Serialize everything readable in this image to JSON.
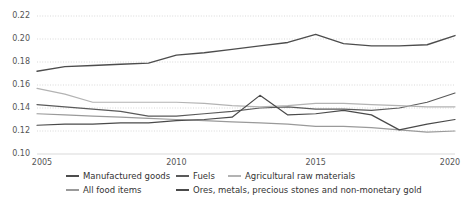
{
  "chart_data": {
    "type": "line",
    "title": "",
    "xlabel": "",
    "ylabel": "",
    "x": [
      2005,
      2006,
      2007,
      2008,
      2009,
      2010,
      2011,
      2012,
      2013,
      2014,
      2015,
      2016,
      2017,
      2018,
      2019,
      2020
    ],
    "xlim": [
      2005,
      2020
    ],
    "ylim": [
      0.1,
      0.22
    ],
    "xticks": [
      "2005",
      "2010",
      "2015",
      "2020"
    ],
    "xtick_values": [
      2005,
      2010,
      2015,
      2020
    ],
    "yticks": [
      "0.22",
      "0.20",
      "0.18",
      "0.16",
      "0.14",
      "0.12",
      "0.10"
    ],
    "ytick_values": [
      0.22,
      0.2,
      0.18,
      0.16,
      0.14,
      0.12,
      0.1
    ],
    "grid": true,
    "grid_style": "dotted-horizontal",
    "legend_position": "bottom",
    "series": [
      {
        "name": "Manufactured goods",
        "color": "#4d4d4d",
        "width": 1.4,
        "values": [
          0.172,
          0.176,
          0.177,
          0.178,
          0.179,
          0.186,
          0.188,
          0.191,
          0.194,
          0.197,
          0.204,
          0.196,
          0.194,
          0.194,
          0.195,
          0.203
        ]
      },
      {
        "name": "Fuels",
        "color": "#5a5a5a",
        "width": 1.2,
        "values": [
          0.143,
          0.141,
          0.139,
          0.137,
          0.133,
          0.133,
          0.135,
          0.137,
          0.14,
          0.141,
          0.139,
          0.139,
          0.138,
          0.14,
          0.145,
          0.153
        ]
      },
      {
        "name": "Agricultural raw materials",
        "color": "#b3b3b3",
        "width": 1.2,
        "values": [
          0.157,
          0.152,
          0.145,
          0.145,
          0.145,
          0.145,
          0.144,
          0.142,
          0.141,
          0.142,
          0.144,
          0.144,
          0.143,
          0.142,
          0.141,
          0.141
        ]
      },
      {
        "name": "All food items",
        "color": "#9a9a9a",
        "width": 1.2,
        "values": [
          0.135,
          0.134,
          0.133,
          0.132,
          0.131,
          0.13,
          0.129,
          0.128,
          0.127,
          0.126,
          0.124,
          0.124,
          0.123,
          0.121,
          0.119,
          0.12
        ]
      },
      {
        "name": "Ores, metals, precious stones and non-monetary gold",
        "color": "#4a4a4a",
        "width": 1.2,
        "values": [
          0.125,
          0.126,
          0.126,
          0.127,
          0.127,
          0.129,
          0.13,
          0.132,
          0.151,
          0.134,
          0.135,
          0.138,
          0.134,
          0.121,
          0.126,
          0.13
        ]
      }
    ]
  },
  "legend": {
    "rows": [
      [
        {
          "label": "Manufactured goods",
          "series": 0
        },
        {
          "label": "Fuels",
          "series": 1
        },
        {
          "label": "Agricultural raw materials",
          "series": 2
        }
      ],
      [
        {
          "label": "All food items",
          "series": 3
        },
        {
          "label": "Ores, metals, precious stones and non-monetary gold",
          "series": 4
        }
      ]
    ]
  },
  "colors": {
    "background": "#ffffff",
    "grid": "#cfcfcf",
    "axis_text": "#555555",
    "legend_text": "#333333"
  }
}
